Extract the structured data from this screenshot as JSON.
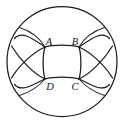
{
  "figure": {
    "type": "geometric-diagram",
    "background_color": "#ffffff",
    "stroke_color": "#1d1d1d",
    "canvas": {
      "width": 125,
      "height": 123
    },
    "outer_circle": {
      "cx": 62,
      "cy": 61.5,
      "r": 55
    },
    "labels": [
      {
        "id": "A",
        "text": "A",
        "x": 49,
        "y": 45,
        "corner": "top-left"
      },
      {
        "id": "B",
        "text": "B",
        "x": 73,
        "y": 45,
        "corner": "top-right"
      },
      {
        "id": "D",
        "text": "D",
        "x": 49,
        "y": 90,
        "corner": "bottom-left"
      },
      {
        "id": "C",
        "text": "C",
        "x": 73,
        "y": 90,
        "corner": "bottom-right"
      }
    ],
    "vertices": [
      {
        "id": "A",
        "x": 45,
        "y": 47
      },
      {
        "id": "B",
        "x": 79,
        "y": 47
      },
      {
        "id": "C",
        "x": 79,
        "y": 79
      },
      {
        "id": "D",
        "x": 45,
        "y": 79
      }
    ],
    "main_arcs": [
      {
        "name": "top-arc-AB",
        "from": "A",
        "to": "B",
        "bulge": "up"
      },
      {
        "name": "right-arc-BC",
        "from": "B",
        "to": "C",
        "bulge": "right"
      },
      {
        "name": "bottom-arc-DC",
        "from": "D",
        "to": "C",
        "bulge": "down"
      },
      {
        "name": "left-arc-AD",
        "from": "A",
        "to": "D",
        "bulge": "left"
      }
    ],
    "corner_arcs": [
      {
        "name": "corner-arc-top-left"
      },
      {
        "name": "corner-arc-top-right"
      },
      {
        "name": "corner-arc-bottom-left"
      },
      {
        "name": "corner-arc-bottom-right"
      }
    ],
    "corner_spokes": [
      {
        "name": "spoke-top-left"
      },
      {
        "name": "spoke-top-right"
      },
      {
        "name": "spoke-bottom-left"
      },
      {
        "name": "spoke-bottom-right"
      }
    ]
  }
}
